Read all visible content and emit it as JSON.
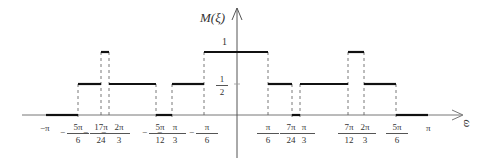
{
  "chart_data": {
    "type": "step",
    "title": "",
    "ylabel": "M(ξ)",
    "xlabel": "ω",
    "y_ticks": [
      "1",
      "1/2"
    ],
    "x_ticks": [
      "-π",
      "-5π/6",
      "-17π/24",
      "-2π/3",
      "-5π/12",
      "-π/3",
      "-π/6",
      "π/6",
      "7π/24",
      "π/3",
      "7π/12",
      "2π/3",
      "5π/6",
      "π"
    ],
    "segments": [
      {
        "from": "-π",
        "to": "-5π/6",
        "value": 0
      },
      {
        "from": "-5π/6",
        "to": "-17π/24",
        "value": 0.5
      },
      {
        "from": "-17π/24",
        "to": "-2π/3",
        "value": 1
      },
      {
        "from": "-2π/3",
        "to": "-5π/12",
        "value": 0.5
      },
      {
        "from": "-5π/12",
        "to": "-π/3",
        "value": 0
      },
      {
        "from": "-π/3",
        "to": "-π/6",
        "value": 0.5
      },
      {
        "from": "-π/6",
        "to": "π/6",
        "value": 1
      },
      {
        "from": "π/6",
        "to": "7π/24",
        "value": 0.5
      },
      {
        "from": "7π/24",
        "to": "π/3",
        "value": 0
      },
      {
        "from": "π/3",
        "to": "7π/12",
        "value": 0.5
      },
      {
        "from": "7π/12",
        "to": "2π/3",
        "value": 1
      },
      {
        "from": "2π/3",
        "to": "5π/6",
        "value": 0.5
      },
      {
        "from": "5π/6",
        "to": "π",
        "value": 0
      }
    ]
  },
  "labels": {
    "y_axis": "M(ξ)",
    "x_axis": "ω",
    "one": "1",
    "half_num": "1",
    "half_den": "2",
    "neg_pi": "−π",
    "pi": "π"
  },
  "ticks": [
    {
      "num": "5π",
      "den": "6",
      "neg": true,
      "x": 78
    },
    {
      "num": "17π",
      "den": "24",
      "neg": true,
      "x": 101
    },
    {
      "num": "2π",
      "den": "3",
      "neg": true,
      "x": 119
    },
    {
      "num": "5π",
      "den": "12",
      "neg": true,
      "x": 160
    },
    {
      "num": "π",
      "den": "3",
      "neg": true,
      "x": 175
    },
    {
      "num": "π",
      "den": "6",
      "neg": true,
      "x": 207
    },
    {
      "num": "π",
      "den": "6",
      "neg": false,
      "x": 268
    },
    {
      "num": "7π",
      "den": "24",
      "neg": false,
      "x": 291
    },
    {
      "num": "π",
      "den": "3",
      "neg": false,
      "x": 304
    },
    {
      "num": "7π",
      "den": "12",
      "neg": false,
      "x": 349
    },
    {
      "num": "2π",
      "den": "3",
      "neg": false,
      "x": 365
    },
    {
      "num": "5π",
      "den": "6",
      "neg": false,
      "x": 397
    }
  ]
}
